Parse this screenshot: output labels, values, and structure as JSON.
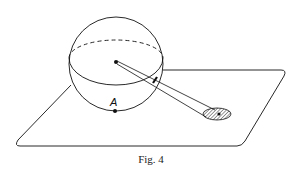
{
  "figure": {
    "caption": "Fig. 4",
    "point_label": "A",
    "colors": {
      "stroke": "#111111",
      "background": "#ffffff",
      "hatch": "#333333"
    },
    "elements": [
      "sphere",
      "equator-ellipse",
      "plane",
      "center-point",
      "point-a",
      "tube-ray",
      "shadow-ellipse"
    ]
  }
}
